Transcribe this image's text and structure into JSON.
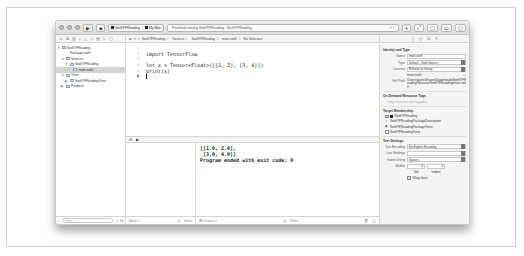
{
  "toolbar": {
    "run_icon": "▶",
    "stop_icon": "■",
    "scheme": "SwiftTFReading",
    "destination": "My Mac",
    "status": "Finished running SwiftTFReading : SwiftTFReading",
    "status_right": "✓ !",
    "right_buttons": [
      "+",
      "⤢",
      "▢",
      "▭",
      "▢"
    ]
  },
  "jump_bar": {
    "nav_back": "<",
    "nav_fwd": ">",
    "crumbs": [
      "SwiftTFReading",
      "Sources",
      "SwiftTFReading",
      "main.swift",
      "No Selection"
    ],
    "separator": "〉"
  },
  "navigator": {
    "items": [
      {
        "label": "SwiftTFReading",
        "indent": 0,
        "expanded": true,
        "type": "project"
      },
      {
        "label": "Package.swift",
        "indent": 2,
        "type": "file"
      },
      {
        "label": "Sources",
        "indent": 1,
        "expanded": true,
        "type": "folder"
      },
      {
        "label": "SwiftTFReading",
        "indent": 2,
        "expanded": true,
        "type": "folder"
      },
      {
        "label": "main.swift",
        "indent": 3,
        "type": "file",
        "selected": true
      },
      {
        "label": "Tests",
        "indent": 1,
        "expanded": true,
        "type": "folder"
      },
      {
        "label": "SwiftTFReadingTests",
        "indent": 2,
        "expanded": false,
        "type": "folder"
      },
      {
        "label": "Products",
        "indent": 1,
        "expanded": false,
        "type": "folder"
      }
    ],
    "filter_placeholder": "Filter",
    "add_label": "+"
  },
  "editor": {
    "line_numbers": [
      "1",
      "2",
      "3",
      "4",
      "5",
      "6"
    ],
    "current_line": "6",
    "lines": [
      "",
      "import TensorFlow",
      "",
      "let x = Tensor<Float>([[1, 2], [3, 4]])",
      "print(x)",
      ""
    ]
  },
  "console": {
    "output": [
      "[[1.0, 2.0],",
      " [3.0, 4.0]]",
      "Program ended with exit code: 0"
    ],
    "vars_scope": "Auto ◊",
    "filter_placeholder": "Filter",
    "output_scope": "All Output ◊",
    "console_filter": "Filter"
  },
  "inspector": {
    "identity_title": "Identity and Type",
    "name_label": "Name",
    "name_value": "main.swift",
    "type_label": "Type",
    "type_value": "Default - Swift Source",
    "location_label": "Location",
    "location_value": "Relative to Group",
    "location_file": "main.swift",
    "fullpath_label": "Full Path",
    "fullpath_value": "/Users/patrickfrazee/Downloads/SwiftTFReading/Sources/SwiftTFReading/main.swift",
    "tags_title": "On Demand Resource Tags",
    "tags_placeholder": "Only resources are taggable",
    "membership_title": "Target Membership",
    "targets": [
      {
        "label": "SwiftTFReading",
        "checked": true
      },
      {
        "label": "SwiftTFReadingPackageDescription",
        "checked": false
      },
      {
        "label": "SwiftTFReadingPackageTests",
        "checked": false
      },
      {
        "label": "SwiftTFReadingTests",
        "checked": false
      }
    ],
    "text_title": "Text Settings",
    "encoding_label": "Text Encoding",
    "encoding_value": "No Explicit Encoding",
    "endings_label": "Line Endings",
    "endings_value": "",
    "indent_label": "Indent Using",
    "indent_value": "Spaces",
    "widths_label": "Widths",
    "tab_value": "4",
    "indent_width": "4",
    "tab_label": "Tab",
    "indentw_label": "Indent",
    "wrap_label": "Wrap lines"
  }
}
